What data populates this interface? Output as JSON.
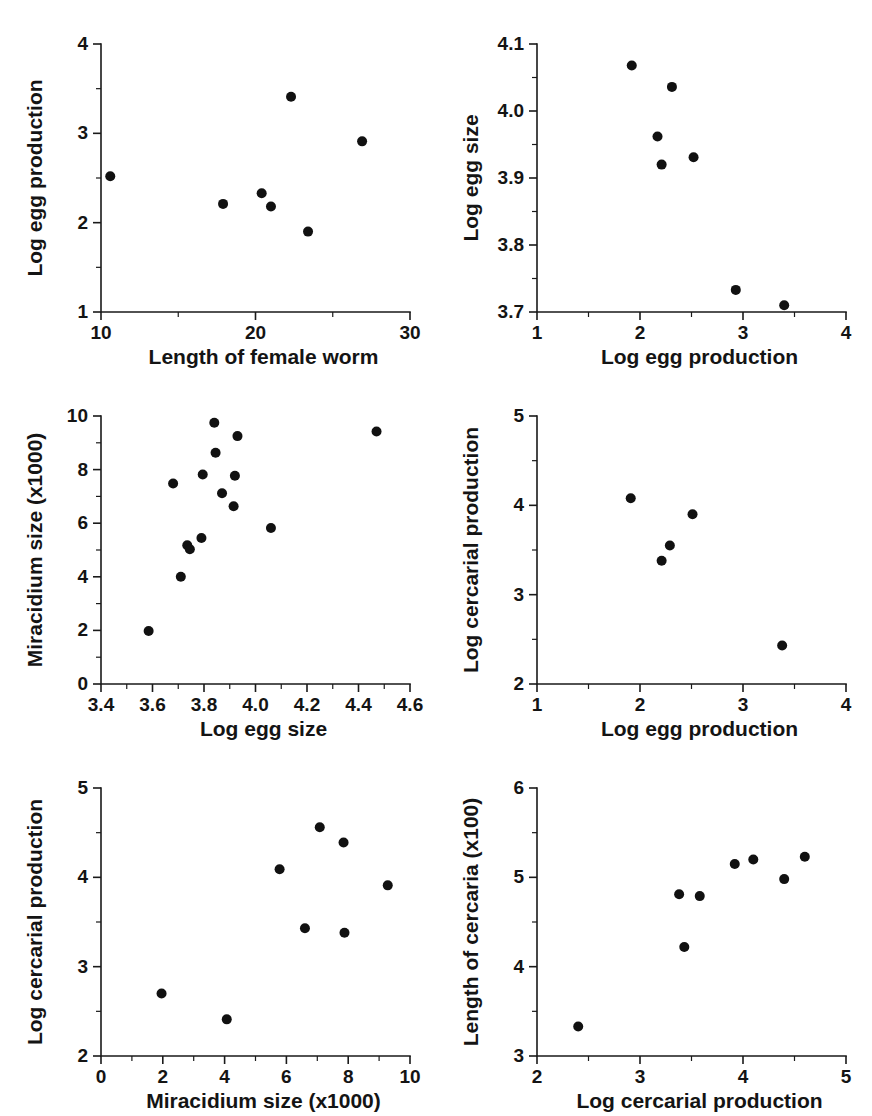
{
  "figure": {
    "title": "",
    "background": "#ffffff",
    "point_color": "#111111",
    "axis_color": "#1a1a1a",
    "panel_count": 6,
    "layout": "3 rows x 2 columns of scatter plots"
  },
  "chart_data": [
    {
      "id": "panel-a",
      "type": "scatter",
      "title": "",
      "xlabel": "Length of female worm",
      "ylabel": "Log egg production",
      "xlim": [
        10,
        30
      ],
      "ylim": [
        1,
        4
      ],
      "xticks": [
        10,
        20,
        30
      ],
      "xticklabels": [
        "10",
        "20",
        "30"
      ],
      "xminorticks": [
        15,
        25
      ],
      "yticks": [
        1,
        2,
        3,
        4
      ],
      "yticklabels": [
        "1",
        "2",
        "3",
        "4"
      ],
      "yminorticks": [
        1.5,
        2.5,
        3.5
      ],
      "grid": false,
      "legend": null,
      "points": [
        {
          "x": 10.6,
          "y": 2.52
        },
        {
          "x": 17.9,
          "y": 2.21
        },
        {
          "x": 20.4,
          "y": 2.33
        },
        {
          "x": 21.0,
          "y": 2.18
        },
        {
          "x": 22.3,
          "y": 3.41
        },
        {
          "x": 23.4,
          "y": 1.9
        },
        {
          "x": 26.9,
          "y": 2.91
        }
      ]
    },
    {
      "id": "panel-b",
      "type": "scatter",
      "title": "",
      "xlabel": "Log egg production",
      "ylabel": "Log egg size",
      "xlim": [
        1,
        4
      ],
      "ylim": [
        3.7,
        4.1
      ],
      "xticks": [
        1,
        2,
        3,
        4
      ],
      "xticklabels": [
        "1",
        "2",
        "3",
        "4"
      ],
      "xminorticks": [
        1.5,
        2.5,
        3.5
      ],
      "yticks": [
        3.7,
        3.8,
        3.9,
        4.0,
        4.1
      ],
      "yticklabels": [
        "3.7",
        "3.8",
        "3.9",
        "4.0",
        "4.1"
      ],
      "yminorticks": [
        3.75,
        3.85,
        3.95,
        4.05
      ],
      "grid": false,
      "legend": null,
      "points": [
        {
          "x": 1.92,
          "y": 4.068
        },
        {
          "x": 2.17,
          "y": 3.962
        },
        {
          "x": 2.21,
          "y": 3.92
        },
        {
          "x": 2.31,
          "y": 4.036
        },
        {
          "x": 2.52,
          "y": 3.931
        },
        {
          "x": 2.93,
          "y": 3.733
        },
        {
          "x": 3.4,
          "y": 3.71
        }
      ]
    },
    {
      "id": "panel-c",
      "type": "scatter",
      "title": "",
      "xlabel": "Log egg size",
      "ylabel": "Miracidium size (x1000)",
      "xlim": [
        3.4,
        4.6
      ],
      "ylim": [
        0,
        10
      ],
      "xticks": [
        3.4,
        3.6,
        3.8,
        4.0,
        4.2,
        4.4,
        4.6
      ],
      "xticklabels": [
        "3.4",
        "3.6",
        "3.8",
        "4.0",
        "4.2",
        "4.4",
        "4.6"
      ],
      "xminorticks": [
        3.5,
        3.7,
        3.9,
        4.1,
        4.3,
        4.5
      ],
      "yticks": [
        0,
        2,
        4,
        6,
        8,
        10
      ],
      "yticklabels": [
        "0",
        "2",
        "4",
        "6",
        "8",
        "10"
      ],
      "yminorticks": [
        1,
        3,
        5,
        7,
        9
      ],
      "grid": false,
      "legend": null,
      "points": [
        {
          "x": 3.585,
          "y": 1.98
        },
        {
          "x": 3.68,
          "y": 7.48
        },
        {
          "x": 3.71,
          "y": 4.0
        },
        {
          "x": 3.735,
          "y": 5.18
        },
        {
          "x": 3.745,
          "y": 5.03
        },
        {
          "x": 3.79,
          "y": 5.45
        },
        {
          "x": 3.795,
          "y": 7.82
        },
        {
          "x": 3.84,
          "y": 9.75
        },
        {
          "x": 3.845,
          "y": 8.63
        },
        {
          "x": 3.87,
          "y": 7.12
        },
        {
          "x": 3.915,
          "y": 6.63
        },
        {
          "x": 3.92,
          "y": 7.77
        },
        {
          "x": 3.93,
          "y": 9.25
        },
        {
          "x": 4.06,
          "y": 5.82
        },
        {
          "x": 4.47,
          "y": 9.42
        }
      ]
    },
    {
      "id": "panel-d",
      "type": "scatter",
      "title": "",
      "xlabel": "Log egg production",
      "ylabel": "Log cercarial production",
      "xlim": [
        1,
        4
      ],
      "ylim": [
        2,
        5
      ],
      "xticks": [
        1,
        2,
        3,
        4
      ],
      "xticklabels": [
        "1",
        "2",
        "3",
        "4"
      ],
      "xminorticks": [
        1.5,
        2.5,
        3.5
      ],
      "yticks": [
        2,
        3,
        4,
        5
      ],
      "yticklabels": [
        "2",
        "3",
        "4",
        "5"
      ],
      "yminorticks": [
        2.5,
        3.5,
        4.5
      ],
      "grid": false,
      "legend": null,
      "points": [
        {
          "x": 1.91,
          "y": 4.08
        },
        {
          "x": 2.21,
          "y": 3.38
        },
        {
          "x": 2.29,
          "y": 3.55
        },
        {
          "x": 2.51,
          "y": 3.9
        },
        {
          "x": 3.38,
          "y": 2.43
        }
      ]
    },
    {
      "id": "panel-e",
      "type": "scatter",
      "title": "",
      "xlabel": "Miracidium size (x1000)",
      "ylabel": "Log cercarial production",
      "xlim": [
        0,
        10
      ],
      "ylim": [
        2,
        5
      ],
      "xticks": [
        0,
        2,
        4,
        6,
        8,
        10
      ],
      "xticklabels": [
        "0",
        "2",
        "4",
        "6",
        "8",
        "10"
      ],
      "xminorticks": [
        1,
        3,
        5,
        7,
        9
      ],
      "yticks": [
        2,
        3,
        4,
        5
      ],
      "yticklabels": [
        "2",
        "3",
        "4",
        "5"
      ],
      "yminorticks": [
        2.5,
        3.5,
        4.5
      ],
      "grid": false,
      "legend": null,
      "points": [
        {
          "x": 1.96,
          "y": 2.7
        },
        {
          "x": 4.07,
          "y": 2.41
        },
        {
          "x": 5.78,
          "y": 4.09
        },
        {
          "x": 6.6,
          "y": 3.43
        },
        {
          "x": 7.08,
          "y": 4.56
        },
        {
          "x": 7.85,
          "y": 4.39
        },
        {
          "x": 7.88,
          "y": 3.38
        },
        {
          "x": 9.28,
          "y": 3.91
        }
      ]
    },
    {
      "id": "panel-f",
      "type": "scatter",
      "title": "",
      "xlabel": "Log cercarial production",
      "ylabel": "Length of cercaria (x100)",
      "xlim": [
        2,
        5
      ],
      "ylim": [
        3,
        6
      ],
      "xticks": [
        2,
        3,
        4,
        5
      ],
      "xticklabels": [
        "2",
        "3",
        "4",
        "5"
      ],
      "xminorticks": [
        2.5,
        3.5,
        4.5
      ],
      "yticks": [
        3,
        4,
        5,
        6
      ],
      "yticklabels": [
        "3",
        "4",
        "5",
        "6"
      ],
      "yminorticks": [
        3.5,
        4.5,
        5.5
      ],
      "grid": false,
      "legend": null,
      "points": [
        {
          "x": 2.4,
          "y": 3.33
        },
        {
          "x": 3.38,
          "y": 4.81
        },
        {
          "x": 3.43,
          "y": 4.22
        },
        {
          "x": 3.58,
          "y": 4.79
        },
        {
          "x": 3.92,
          "y": 5.15
        },
        {
          "x": 4.1,
          "y": 5.2
        },
        {
          "x": 4.4,
          "y": 4.98
        },
        {
          "x": 4.6,
          "y": 5.23
        }
      ]
    }
  ]
}
